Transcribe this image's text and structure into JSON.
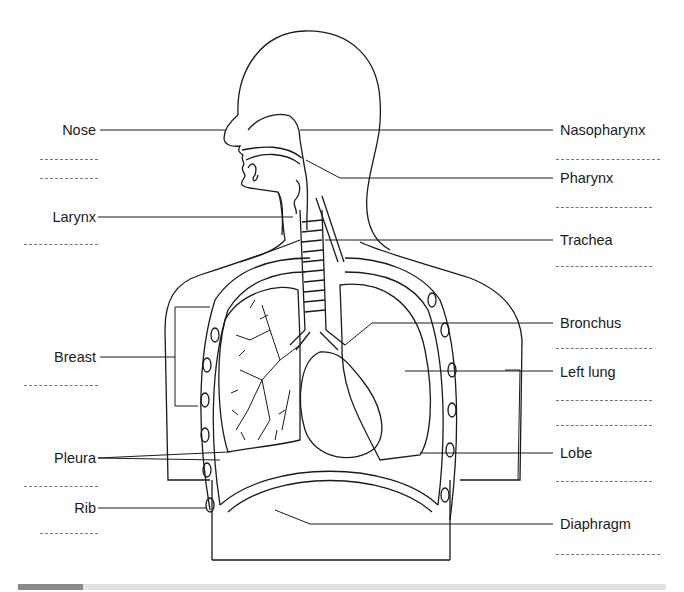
{
  "diagram": {
    "labels_left": [
      {
        "id": "nose",
        "text": "Nose"
      },
      {
        "id": "larynx",
        "text": "Larynx"
      },
      {
        "id": "breast",
        "text": "Breast"
      },
      {
        "id": "pleura",
        "text": "Pleura"
      },
      {
        "id": "rib",
        "text": "Rib"
      }
    ],
    "labels_right": [
      {
        "id": "nasopharynx",
        "text": "Nasopharynx"
      },
      {
        "id": "pharynx",
        "text": "Pharynx"
      },
      {
        "id": "trachea",
        "text": "Trachea"
      },
      {
        "id": "bronchus",
        "text": "Bronchus"
      },
      {
        "id": "left_lung",
        "text": "Left lung"
      },
      {
        "id": "lobe",
        "text": "Lobe"
      },
      {
        "id": "diaphragm",
        "text": "Diaphragm"
      }
    ],
    "colors": {
      "line": "#1a1a1a",
      "blank": "#777777",
      "bar": "#e2e2e2",
      "bar_accent": "#8a8a8a"
    }
  }
}
